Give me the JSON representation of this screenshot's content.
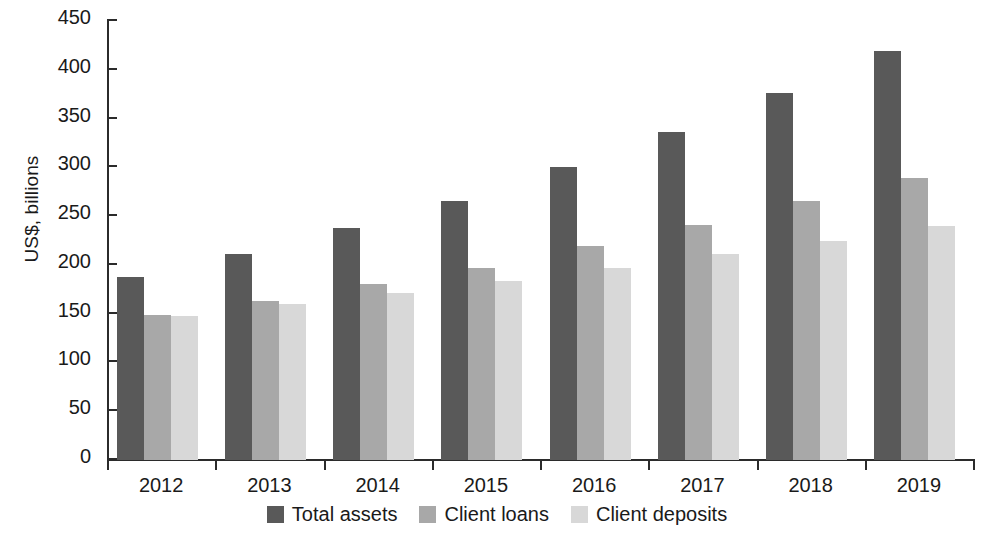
{
  "chart_data": {
    "type": "bar",
    "title": "",
    "xlabel": "",
    "ylabel": "US$, billions",
    "ylim": [
      0,
      450
    ],
    "ytick_step": 50,
    "yticks": [
      0,
      50,
      100,
      150,
      200,
      250,
      300,
      350,
      400,
      450
    ],
    "ytick_labels": [
      "0",
      "50",
      "100",
      "150",
      "200",
      "250",
      "300",
      "350",
      "400",
      "450"
    ],
    "grid": false,
    "legend_position": "bottom",
    "categories": [
      "2012",
      "2013",
      "2014",
      "2015",
      "2016",
      "2017",
      "2018",
      "2019"
    ],
    "series": [
      {
        "name": "Total assets",
        "color": "#595959",
        "values": [
          188,
          211,
          238,
          266,
          300,
          336,
          376,
          419
        ]
      },
      {
        "name": "Client loans",
        "color": "#a8a8a8",
        "values": [
          149,
          163,
          180,
          197,
          219,
          241,
          265,
          289
        ]
      },
      {
        "name": "Client deposits",
        "color": "#d8d8d8",
        "values": [
          148,
          160,
          171,
          184,
          197,
          211,
          225,
          240
        ]
      }
    ]
  },
  "axis": {
    "y_title": "US$, billions"
  },
  "legend": {
    "items": [
      {
        "label": "Total assets",
        "color": "#595959"
      },
      {
        "label": "Client loans",
        "color": "#a8a8a8"
      },
      {
        "label": "Client deposits",
        "color": "#d8d8d8"
      }
    ]
  }
}
